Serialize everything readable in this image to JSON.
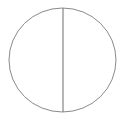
{
  "diagram": {
    "type": "circle-with-vertical-diameter",
    "circle": {
      "cx": 62.5,
      "cy": 60,
      "rx": 53.5,
      "ry": 52,
      "stroke": "#8a8a8a",
      "stroke_width": 1
    },
    "diameter": {
      "x": 63,
      "y1": 8,
      "y2": 112,
      "stroke": "#6e6e6e",
      "stroke_width": 1
    },
    "background": "#ffffff"
  }
}
